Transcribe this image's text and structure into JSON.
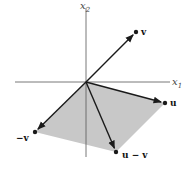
{
  "diagram": {
    "origin": [
      86,
      82
    ],
    "axes": {
      "x1": {
        "label": "x",
        "subscript": "1",
        "from": [
          15,
          82
        ],
        "to": [
          170,
          82
        ]
      },
      "x2": {
        "label": "x",
        "subscript": "2",
        "from": [
          86,
          157
        ],
        "to": [
          86,
          8
        ]
      }
    },
    "parallelogram": {
      "fill": "#c8c8c8",
      "points": [
        [
          86,
          82
        ],
        [
          165,
          103
        ],
        [
          116,
          152
        ],
        [
          35,
          132
        ]
      ]
    },
    "vectors": [
      {
        "id": "v",
        "label": "v",
        "end": [
          136,
          32
        ],
        "label_pos": [
          141,
          35
        ]
      },
      {
        "id": "u",
        "label": "u",
        "end": [
          165,
          103
        ],
        "label_pos": [
          170,
          106
        ]
      },
      {
        "id": "neg_v",
        "label": "−v",
        "end": [
          35,
          132
        ],
        "label_pos": [
          16,
          141
        ]
      },
      {
        "id": "u_minus_v",
        "label": "u − v",
        "end": [
          116,
          152
        ],
        "label_pos": [
          122,
          158
        ]
      }
    ],
    "colors": {
      "vector": "#1a1a1a",
      "axis": "#555555",
      "fill": "#c8c8c8"
    }
  }
}
